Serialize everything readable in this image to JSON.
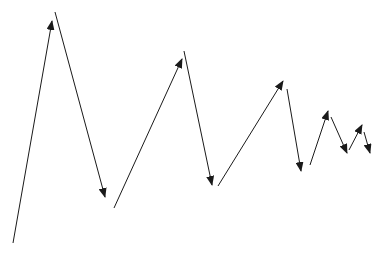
{
  "diagram": {
    "background": "#ffffff",
    "stroke_color": "#1a1a1a",
    "stroke_width": 1,
    "arrows": [
      {
        "id": "arrow-1",
        "x1": 13,
        "y1": 243,
        "x2": 52,
        "y2": 21
      },
      {
        "id": "arrow-2",
        "x1": 55,
        "y1": 12,
        "x2": 105,
        "y2": 197
      },
      {
        "id": "arrow-3",
        "x1": 114,
        "y1": 208,
        "x2": 182,
        "y2": 59
      },
      {
        "id": "arrow-4",
        "x1": 184,
        "y1": 51,
        "x2": 212,
        "y2": 185
      },
      {
        "id": "arrow-5",
        "x1": 218,
        "y1": 186,
        "x2": 283,
        "y2": 81
      },
      {
        "id": "arrow-6",
        "x1": 287,
        "y1": 89,
        "x2": 301,
        "y2": 171
      },
      {
        "id": "arrow-7",
        "x1": 310,
        "y1": 165,
        "x2": 328,
        "y2": 111
      },
      {
        "id": "arrow-8",
        "x1": 331,
        "y1": 117,
        "x2": 347,
        "y2": 153
      },
      {
        "id": "arrow-9",
        "x1": 349,
        "y1": 150,
        "x2": 362,
        "y2": 125
      },
      {
        "id": "arrow-10",
        "x1": 364,
        "y1": 132,
        "x2": 370,
        "y2": 153
      }
    ]
  }
}
